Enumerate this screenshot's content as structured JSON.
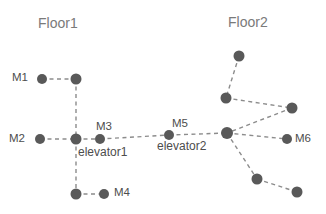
{
  "figure": {
    "background_color": "#ffffff",
    "node_color": "#595959",
    "edge_color": "#8c8c8c",
    "label_color": "#4d4d4d",
    "floor_label_color": "#7a7a7a"
  },
  "floors": [
    {
      "id": "floor1",
      "label": "Floor1",
      "x": 38,
      "y": 16
    },
    {
      "id": "floor2",
      "label": "Floor2",
      "x": 228,
      "y": 15
    }
  ],
  "nodes": [
    {
      "id": "m1",
      "label": "M1",
      "cx": 42,
      "cy": 79,
      "r": 5.0,
      "label_x": 12,
      "label_y": 72
    },
    {
      "id": "j1",
      "label": "",
      "cx": 76,
      "cy": 79,
      "r": 5.5,
      "label_x": 0,
      "label_y": 0
    },
    {
      "id": "m2",
      "label": "M2",
      "cx": 40,
      "cy": 139,
      "r": 5.0,
      "label_x": 9,
      "label_y": 133
    },
    {
      "id": "elevator1",
      "label": "elevator1",
      "cx": 76,
      "cy": 139,
      "r": 5.5,
      "label_x": 78,
      "label_y": 146
    },
    {
      "id": "m3",
      "label": "M3",
      "cx": 100,
      "cy": 139,
      "r": 5.0,
      "label_x": 96,
      "label_y": 121
    },
    {
      "id": "j2",
      "label": "",
      "cx": 76,
      "cy": 194,
      "r": 5.5,
      "label_x": 0,
      "label_y": 0
    },
    {
      "id": "m4",
      "label": "M4",
      "cx": 104,
      "cy": 194,
      "r": 5.0,
      "label_x": 114,
      "label_y": 187
    },
    {
      "id": "m5",
      "label": "M5",
      "cx": 169,
      "cy": 135,
      "r": 5.0,
      "label_x": 172,
      "label_y": 118
    },
    {
      "id": "elevator2",
      "label": "elevator2",
      "cx": 227,
      "cy": 133,
      "r": 6.0,
      "label_x": 157,
      "label_y": 140
    },
    {
      "id": "n_top",
      "label": "",
      "cx": 239,
      "cy": 56,
      "r": 5.5,
      "label_x": 0,
      "label_y": 0
    },
    {
      "id": "n_midleft",
      "label": "",
      "cx": 226,
      "cy": 98,
      "r": 5.5,
      "label_x": 0,
      "label_y": 0
    },
    {
      "id": "n_right",
      "label": "",
      "cx": 292,
      "cy": 108,
      "r": 5.5,
      "label_x": 0,
      "label_y": 0
    },
    {
      "id": "m6",
      "label": "M6",
      "cx": 287,
      "cy": 139,
      "r": 5.0,
      "label_x": 295,
      "label_y": 133
    },
    {
      "id": "n_botmid",
      "label": "",
      "cx": 257,
      "cy": 179,
      "r": 5.5,
      "label_x": 0,
      "label_y": 0
    },
    {
      "id": "n_botright",
      "label": "",
      "cx": 297,
      "cy": 192,
      "r": 5.5,
      "label_x": 0,
      "label_y": 0
    }
  ],
  "edges": [
    {
      "from": "m1",
      "to": "j1"
    },
    {
      "from": "j1",
      "to": "elevator1"
    },
    {
      "from": "m2",
      "to": "elevator1"
    },
    {
      "from": "elevator1",
      "to": "m3"
    },
    {
      "from": "elevator1",
      "to": "j2"
    },
    {
      "from": "j2",
      "to": "m4"
    },
    {
      "from": "m3",
      "to": "m5"
    },
    {
      "from": "m5",
      "to": "elevator2"
    },
    {
      "from": "n_top",
      "to": "n_midleft"
    },
    {
      "from": "n_midleft",
      "to": "n_right"
    },
    {
      "from": "n_right",
      "to": "elevator2"
    },
    {
      "from": "elevator2",
      "to": "m6"
    },
    {
      "from": "elevator2",
      "to": "n_botmid"
    },
    {
      "from": "n_botmid",
      "to": "n_botright"
    }
  ]
}
